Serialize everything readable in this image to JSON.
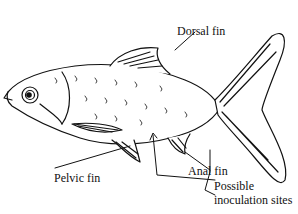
{
  "diagram": {
    "labels": {
      "dorsal_fin": "Dorsal fin",
      "pelvic_fin": "Pelvic fin",
      "anal_fin": "Anal fin",
      "inoculation_line1": "Possible",
      "inoculation_line2": "inoculation sites"
    },
    "colors": {
      "ink": "#111111",
      "background": "#ffffff"
    }
  }
}
